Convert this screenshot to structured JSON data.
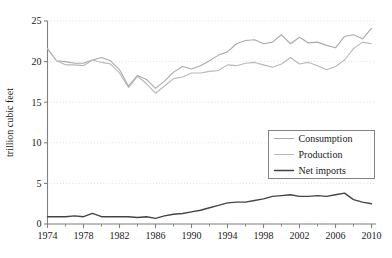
{
  "chart_data": {
    "type": "line",
    "title": "",
    "subtitle": "",
    "xlabel": "",
    "ylabel": "trillion cubic feet",
    "xlim": [
      1974,
      2010.5
    ],
    "ylim": [
      0,
      25
    ],
    "yticks": [
      0,
      5,
      10,
      15,
      20,
      25
    ],
    "ytick_labels": [
      "0",
      "5",
      "10",
      "15",
      "20",
      "25"
    ],
    "xticks": [
      1974,
      1978,
      1982,
      1986,
      1990,
      1994,
      1998,
      2002,
      2006,
      2010
    ],
    "xtick_labels": [
      "1974",
      "1978",
      "1982",
      "1986",
      "1990",
      "1994",
      "1998",
      "2002",
      "2006",
      "2010"
    ],
    "x_minor_ticks": [
      1976,
      1980,
      1984,
      1988,
      1992,
      1996,
      2000,
      2004,
      2008
    ],
    "grid": "horizontal-dotted",
    "legend_position": "center-right",
    "x": [
      1974,
      1975,
      1976,
      1977,
      1978,
      1979,
      1980,
      1981,
      1982,
      1983,
      1984,
      1985,
      1986,
      1987,
      1988,
      1989,
      1990,
      1991,
      1992,
      1993,
      1994,
      1995,
      1996,
      1997,
      1998,
      1999,
      2000,
      2001,
      2002,
      2003,
      2004,
      2005,
      2006,
      2007,
      2008,
      2009,
      2010
    ],
    "series": [
      {
        "name": "Consumption",
        "color": "#aaaaaa",
        "width": 1.1,
        "values": [
          21.6,
          20.1,
          20.0,
          19.8,
          19.8,
          20.2,
          20.5,
          20.1,
          19.0,
          17.0,
          18.3,
          17.8,
          16.7,
          17.6,
          18.7,
          19.4,
          19.1,
          19.5,
          20.1,
          20.8,
          21.2,
          22.2,
          22.6,
          22.7,
          22.2,
          22.4,
          23.3,
          22.2,
          23.0,
          22.3,
          22.4,
          22.0,
          21.7,
          23.1,
          23.3,
          22.8,
          24.1
        ],
        "note": "upper light gray line"
      },
      {
        "name": "Production",
        "color": "#b8b8b8",
        "width": 1.1,
        "values": [
          21.6,
          20.1,
          19.6,
          19.6,
          19.5,
          20.2,
          19.9,
          19.7,
          18.6,
          16.8,
          18.2,
          17.3,
          16.1,
          17.0,
          17.9,
          18.1,
          18.6,
          18.6,
          18.8,
          18.9,
          19.6,
          19.5,
          19.8,
          19.9,
          19.6,
          19.3,
          19.7,
          20.5,
          19.7,
          19.9,
          19.5,
          19.0,
          19.4,
          20.2,
          21.6,
          22.4,
          22.2
        ],
        "note": "lower light gray line"
      },
      {
        "name": "Net imports",
        "color": "#444444",
        "width": 1.4,
        "values": [
          0.9,
          0.9,
          0.9,
          1.0,
          0.9,
          1.3,
          0.9,
          0.9,
          0.9,
          0.9,
          0.8,
          0.9,
          0.7,
          1.0,
          1.2,
          1.3,
          1.5,
          1.7,
          2.0,
          2.3,
          2.6,
          2.7,
          2.7,
          2.9,
          3.1,
          3.4,
          3.5,
          3.6,
          3.4,
          3.4,
          3.5,
          3.4,
          3.6,
          3.8,
          3.0,
          2.7,
          2.5
        ],
        "note": "dark solid bottom line"
      }
    ]
  },
  "legend": {
    "items": [
      {
        "label": "Consumption"
      },
      {
        "label": "Production"
      },
      {
        "label": "Net imports"
      }
    ]
  },
  "axes": {
    "y_axis_title": "trillion cubic feet"
  },
  "colors": {
    "background": "#ffffff",
    "axis": "#808080",
    "grid": "#dcdcdc",
    "text": "#1a1a1a",
    "consumption": "#aaaaaa",
    "production": "#b8b8b8",
    "net_imports": "#444444",
    "legend_border": "#777777"
  }
}
